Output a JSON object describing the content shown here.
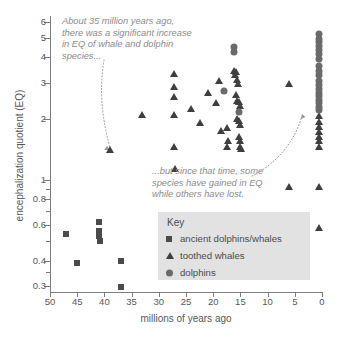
{
  "chart_data": {
    "type": "scatter",
    "title": "",
    "xlabel": "millions of years ago",
    "ylabel": "encephalization quotient (EQ)",
    "xlim": [
      50,
      0
    ],
    "ylim": [
      0.28,
      6.4
    ],
    "x_inverted": true,
    "yscale": "log",
    "grid": false,
    "legend_position": "inside-lower-right",
    "xticks": [
      50,
      45,
      40,
      35,
      30,
      25,
      20,
      15,
      10,
      5,
      0
    ],
    "yticks": [
      6,
      5,
      4,
      3,
      2,
      1,
      0.8,
      0.6,
      0.4,
      0.3
    ],
    "y_minor_ticks": [
      0.9,
      0.7,
      0.5,
      0.35
    ],
    "series": [
      {
        "name": "ancient dolphins/whales",
        "marker": "square",
        "color": "#4b4b4d",
        "points": [
          [
            47.0,
            0.54
          ],
          [
            45.0,
            0.39
          ],
          [
            41.0,
            0.62
          ],
          [
            41.0,
            0.56
          ],
          [
            41.0,
            0.53
          ],
          [
            40.8,
            0.5
          ],
          [
            37.0,
            0.4
          ],
          [
            37.0,
            0.295
          ]
        ]
      },
      {
        "name": "toothed whales",
        "marker": "triangle",
        "color": "#3f3f42",
        "points": [
          [
            39.0,
            1.4
          ],
          [
            33.0,
            2.08
          ],
          [
            27.2,
            3.3
          ],
          [
            27.2,
            2.87
          ],
          [
            27.2,
            2.55
          ],
          [
            27.2,
            2.08
          ],
          [
            27.2,
            1.45
          ],
          [
            27.0,
            1.13
          ],
          [
            24.0,
            2.23
          ],
          [
            22.5,
            1.9
          ],
          [
            21.0,
            2.68
          ],
          [
            19.5,
            2.38
          ],
          [
            19.0,
            3.08
          ],
          [
            18.5,
            1.73
          ],
          [
            17.5,
            1.8
          ],
          [
            17.5,
            1.45
          ],
          [
            17.3,
            1.55
          ],
          [
            16.2,
            3.45
          ],
          [
            16.0,
            3.28
          ],
          [
            15.8,
            3.4
          ],
          [
            15.6,
            3.1
          ],
          [
            15.4,
            2.95
          ],
          [
            15.8,
            2.62
          ],
          [
            15.6,
            2.45
          ],
          [
            15.3,
            2.42
          ],
          [
            15.1,
            2.3
          ],
          [
            15.6,
            2.0
          ],
          [
            15.2,
            1.95
          ],
          [
            15.0,
            1.85
          ],
          [
            15.3,
            1.62
          ],
          [
            15.1,
            1.55
          ],
          [
            15.0,
            1.45
          ],
          [
            14.8,
            1.42
          ],
          [
            6.0,
            2.95
          ],
          [
            6.0,
            0.92
          ],
          [
            0.6,
            0.92
          ],
          [
            0.5,
            0.58
          ],
          [
            0.5,
            2.05
          ],
          [
            0.5,
            1.92
          ],
          [
            0.5,
            1.82
          ],
          [
            0.5,
            1.72
          ],
          [
            0.5,
            1.62
          ],
          [
            0.5,
            1.55
          ],
          [
            0.5,
            1.45
          ]
        ]
      },
      {
        "name": "dolphins",
        "marker": "circle",
        "color": "#6a6a6d",
        "points": [
          [
            16.2,
            4.52
          ],
          [
            16.2,
            4.25
          ],
          [
            18.0,
            2.72
          ],
          [
            15.3,
            2.15
          ],
          [
            0.5,
            5.2
          ],
          [
            0.5,
            4.95
          ],
          [
            0.5,
            4.75
          ],
          [
            0.5,
            4.55
          ],
          [
            0.5,
            4.35
          ],
          [
            0.5,
            4.15
          ],
          [
            0.5,
            3.95
          ],
          [
            0.5,
            3.62
          ],
          [
            0.5,
            3.45
          ],
          [
            0.5,
            3.28
          ],
          [
            0.5,
            3.05
          ],
          [
            0.5,
            2.92
          ],
          [
            0.5,
            2.8
          ],
          [
            0.5,
            2.68
          ],
          [
            0.5,
            2.58
          ],
          [
            0.5,
            2.48
          ],
          [
            0.5,
            2.38
          ],
          [
            0.5,
            2.28
          ],
          [
            0.5,
            2.2
          ]
        ]
      }
    ],
    "annotations": [
      {
        "id": "annot-top",
        "text": "About 35 million years ago,\nthere was a significant increase\nin EQ of whale and dolphin\nspecies..."
      },
      {
        "id": "annot-bottom",
        "text": "...but since that time, some\nspecies have gained in EQ\nwhile others have lost."
      }
    ]
  },
  "legend": {
    "title": "Key",
    "items": [
      {
        "label": "ancient dolphins/whales",
        "marker": "square"
      },
      {
        "label": "toothed whales",
        "marker": "triangle"
      },
      {
        "label": "dolphins",
        "marker": "circle"
      }
    ]
  },
  "colors": {
    "axis": "#7d7d80",
    "text": "#58585a",
    "annotation": "#8b8b8e",
    "legend_background": "#e2e2e2",
    "square": "#4b4b4d",
    "triangle": "#3f3f42",
    "circle": "#6a6a6d"
  }
}
